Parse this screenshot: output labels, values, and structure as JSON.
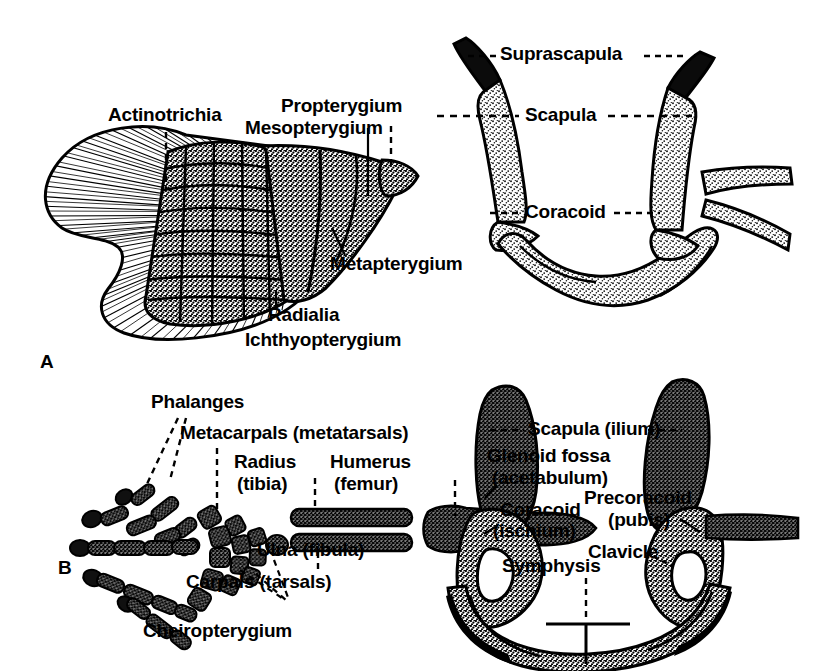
{
  "figure": {
    "background_color": "#ffffff",
    "ink_color": "#000000"
  },
  "panels": [
    {
      "id": "A",
      "letter": "A",
      "caption": "Ichthyopterygium",
      "description": "Fish pectoral fin and pectoral girdle",
      "labels": [
        {
          "name": "actinotrichia",
          "text": "Actinotrichia",
          "leader": "dashed-vertical"
        },
        {
          "name": "propterygium",
          "text": "Propterygium",
          "leader": "dashed-vertical"
        },
        {
          "name": "mesopterygium",
          "text": "Mesopterygium",
          "leader": "solid-vertical"
        },
        {
          "name": "metapterygium",
          "text": "Metapterygium",
          "leader": "solid-diagonal"
        },
        {
          "name": "radialia",
          "text": "Radialia",
          "leader": "solid-vertical"
        },
        {
          "name": "ichthyopterygium",
          "text": "Ichthyopterygium",
          "leader": "none"
        },
        {
          "name": "suprascapula",
          "text": "Suprascapula",
          "leader": "dashed-both-sides"
        },
        {
          "name": "scapula",
          "text": "Scapula",
          "leader": "dashed-both-sides"
        },
        {
          "name": "coracoid",
          "text": "Coracoid",
          "leader": "dashed-both-sides"
        }
      ]
    },
    {
      "id": "B",
      "letter": "B",
      "caption": "Cheiropterygium",
      "description": "Tetrapod limb and girdle; parentheses give the hind-limb / pelvic homologues",
      "labels": [
        {
          "name": "phalanges",
          "text": "Phalanges",
          "leader": "dashed-two-branches"
        },
        {
          "name": "metacarpals",
          "text": "Metacarpals (metatarsals)",
          "leader": "dashed-vertical"
        },
        {
          "name": "radius",
          "text": "Radius",
          "sub": "(tibia)",
          "leader": "dashed-vertical"
        },
        {
          "name": "humerus",
          "text": "Humerus",
          "sub": "(femur)",
          "leader": "dashed-vertical"
        },
        {
          "name": "ulna",
          "text": "Ulna (fibula)",
          "leader": "dashed-vertical"
        },
        {
          "name": "carpals",
          "text": "Carpals (tarsals)",
          "leader": "dashed-three-branches"
        },
        {
          "name": "scapula-ilium",
          "text": "Scapula (ilium)",
          "leader": "dashed-both-sides"
        },
        {
          "name": "glenoid-fossa",
          "text": "Glenoid fossa",
          "sub": "(acetabulum)",
          "leader": "solid-short"
        },
        {
          "name": "coracoid-ischium",
          "text": "Coracoid",
          "sub": "(ischium)",
          "leader": "solid-short"
        },
        {
          "name": "precoracoid-pubis",
          "text": "Precoracoid",
          "sub": "(pubis)",
          "leader": "solid-short"
        },
        {
          "name": "clavicle",
          "text": "Clavicle",
          "leader": "dashed-short"
        },
        {
          "name": "symphysis",
          "text": "Symphysis",
          "leader": "dashed-vertical"
        }
      ]
    }
  ],
  "panelA": {
    "letter": "A",
    "actinotrichia": "Actinotrichia",
    "propterygium": "Propterygium",
    "mesopterygium": "Mesopterygium",
    "metapterygium": "Metapterygium",
    "radialia": "Radialia",
    "ichthyopterygium": "Ichthyopterygium",
    "suprascapula": "Suprascapula",
    "scapula": "Scapula",
    "coracoid": "Coracoid"
  },
  "panelB": {
    "letter": "B",
    "phalanges": "Phalanges",
    "metacarpals": "Metacarpals (metatarsals)",
    "radius": "Radius",
    "radius_sub": "(tibia)",
    "humerus": "Humerus",
    "humerus_sub": "(femur)",
    "ulna": "Ulna (fibula)",
    "carpals": "Carpals (tarsals)",
    "cheiropterygium": "Cheiropterygium",
    "scapula_ilium": "Scapula (ilium)",
    "glenoid_fossa": "Glenoid fossa",
    "glenoid_fossa_sub": "(acetabulum)",
    "coracoid_ischium": "Coracoid",
    "coracoid_ischium_sub": "(ischium)",
    "precoracoid_pubis": "Precoracoid",
    "precoracoid_pubis_sub": "(pubis)",
    "clavicle": "Clavicle",
    "symphysis": "Symphysis"
  }
}
